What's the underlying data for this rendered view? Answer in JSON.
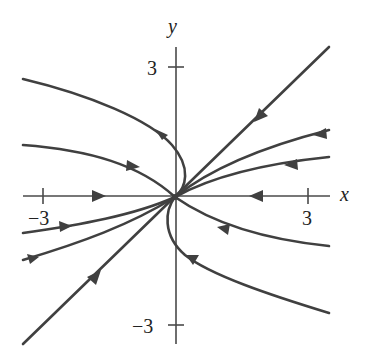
{
  "diagram": {
    "type": "phase-portrait",
    "axes": {
      "x_label": "x",
      "y_label": "y",
      "x_ticks": [
        {
          "value": -3,
          "label": "−3"
        },
        {
          "value": 3,
          "label": "3"
        }
      ],
      "y_ticks": [
        {
          "value": 3,
          "label": "3"
        },
        {
          "value": -3,
          "label": "−3"
        }
      ],
      "x_range": [
        -3.5,
        3.5
      ],
      "y_range": [
        -3.5,
        3.5
      ]
    },
    "equilibrium": {
      "x": 0,
      "y": 0,
      "kind": "node"
    },
    "trajectories": [
      {
        "id": "upper-left-outer",
        "direction": "toward-origin"
      },
      {
        "id": "upper-left-inner",
        "direction": "toward-origin"
      },
      {
        "id": "x-axis-left",
        "direction": "toward-origin"
      },
      {
        "id": "x-axis-right",
        "direction": "toward-origin"
      },
      {
        "id": "diagonal-lower-left",
        "direction": "toward-origin"
      },
      {
        "id": "diagonal-upper-right",
        "direction": "toward-origin"
      },
      {
        "id": "upper-right-1",
        "direction": "toward-origin"
      },
      {
        "id": "upper-right-2",
        "direction": "toward-origin"
      },
      {
        "id": "lower-left-1",
        "direction": "toward-origin"
      },
      {
        "id": "lower-left-2",
        "direction": "toward-origin"
      },
      {
        "id": "lower-right-inner",
        "direction": "toward-origin"
      },
      {
        "id": "lower-right-outer",
        "direction": "toward-origin"
      }
    ],
    "colors": {
      "curve": "#404040",
      "axis": "#4a4a4a",
      "text": "#222222"
    }
  }
}
